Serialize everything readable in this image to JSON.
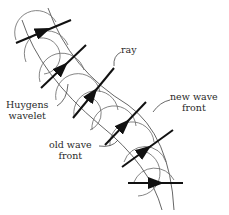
{
  "figure": {
    "labels": {
      "ray": "ray",
      "new_wave_front_line1": "new wave",
      "new_wave_front_line2": "front",
      "huygens_line1": "Huygens",
      "huygens_line2": "wavelet",
      "old_wave_front_line1": "old wave",
      "old_wave_front_line2": "front"
    },
    "colors": {
      "thin_line": "#555555",
      "ray": "#111111",
      "text": "#2a2a2a"
    },
    "ray_count": 6
  }
}
